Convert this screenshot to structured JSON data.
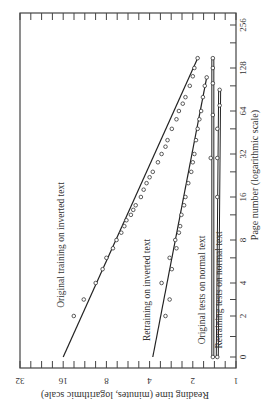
{
  "chart_data": {
    "type": "scatter",
    "orientation": "rotated-90-clockwise",
    "title": "",
    "xlabel": "Page number (logarithmic scale)",
    "ylabel": "Reading time (minutes, logarithmic scale)",
    "x_ticks": [
      "0",
      "2",
      "4",
      "8",
      "16",
      "32",
      "64",
      "128",
      "256"
    ],
    "y_ticks": [
      "1",
      "2",
      "4",
      "8",
      "16",
      "32"
    ],
    "xlim": [
      0,
      256
    ],
    "ylim": [
      1,
      32
    ],
    "grid": false,
    "series": [
      {
        "name": "Original training on inverted text",
        "fit_line": [
          [
            0,
            16
          ],
          [
            150,
            1.85
          ]
        ],
        "points": [
          [
            2,
            13.5
          ],
          [
            3,
            11.5
          ],
          [
            4,
            9.5
          ],
          [
            5,
            8.5
          ],
          [
            6,
            8
          ],
          [
            7,
            7.2
          ],
          [
            8,
            6.8
          ],
          [
            9,
            6.3
          ],
          [
            10,
            6
          ],
          [
            11,
            5.8
          ],
          [
            12,
            5.4
          ],
          [
            13,
            5.2
          ],
          [
            14,
            5
          ],
          [
            16,
            4.6
          ],
          [
            18,
            4.4
          ],
          [
            20,
            4.2
          ],
          [
            22,
            4
          ],
          [
            24,
            3.8
          ],
          [
            28,
            3.5
          ],
          [
            32,
            3.3
          ],
          [
            36,
            3.1
          ],
          [
            40,
            3
          ],
          [
            48,
            2.8
          ],
          [
            56,
            2.6
          ],
          [
            64,
            2.5
          ],
          [
            72,
            2.35
          ],
          [
            80,
            2.25
          ],
          [
            96,
            2.1
          ],
          [
            112,
            2
          ],
          [
            128,
            1.95
          ],
          [
            150,
            1.85
          ]
        ]
      },
      {
        "name": "Retraining on inverted text",
        "fit_line": [
          [
            0,
            3.8
          ],
          [
            110,
            1.6
          ]
        ],
        "points": [
          [
            2,
            3.1
          ],
          [
            3,
            2.9
          ],
          [
            4,
            3.3
          ],
          [
            5,
            2.8
          ],
          [
            6,
            2.9
          ],
          [
            7,
            2.6
          ],
          [
            8,
            2.65
          ],
          [
            9,
            2.5
          ],
          [
            10,
            2.45
          ],
          [
            12,
            2.4
          ],
          [
            14,
            2.3
          ],
          [
            16,
            2.25
          ],
          [
            20,
            2.15
          ],
          [
            24,
            2.05
          ],
          [
            28,
            2
          ],
          [
            32,
            1.95
          ],
          [
            40,
            1.9
          ],
          [
            48,
            1.85
          ],
          [
            56,
            1.8
          ],
          [
            64,
            1.75
          ],
          [
            80,
            1.7
          ],
          [
            96,
            1.65
          ],
          [
            110,
            1.6
          ]
        ]
      },
      {
        "name": "Original tests on normal text",
        "fit_line": [
          [
            0,
            1.45
          ],
          [
            150,
            1.45
          ]
        ],
        "points": [
          [
            0,
            1.45
          ],
          [
            30,
            1.5
          ],
          [
            60,
            1.45
          ],
          [
            100,
            1.45
          ],
          [
            128,
            1.45
          ],
          [
            150,
            1.45
          ]
        ]
      },
      {
        "name": "Retraining tests on normal text",
        "fit_line": [
          [
            0,
            1.35
          ],
          [
            90,
            1.3
          ]
        ],
        "points": [
          [
            0,
            1.35
          ],
          [
            16,
            1.35
          ],
          [
            30,
            1.35
          ],
          [
            48,
            1.35
          ],
          [
            70,
            1.3
          ],
          [
            90,
            1.3
          ]
        ]
      }
    ]
  },
  "axes": {
    "page_label": "Page number (logarithmic scale)",
    "time_label": "Reading time (minutes, logarithmic scale)"
  }
}
